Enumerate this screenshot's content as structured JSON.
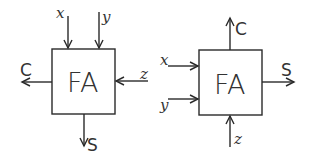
{
  "diagram": {
    "left": {
      "block_label": "FA",
      "inputs": [
        {
          "name": "x",
          "side": "top"
        },
        {
          "name": "y",
          "side": "top"
        },
        {
          "name": "z",
          "side": "right"
        }
      ],
      "outputs": [
        {
          "name": "C",
          "side": "left"
        },
        {
          "name": "S",
          "side": "bottom"
        }
      ]
    },
    "right": {
      "block_label": "FA",
      "inputs": [
        {
          "name": "x",
          "side": "left"
        },
        {
          "name": "y",
          "side": "left"
        },
        {
          "name": "z",
          "side": "bottom"
        }
      ],
      "outputs": [
        {
          "name": "C",
          "side": "top"
        },
        {
          "name": "S",
          "side": "right"
        }
      ]
    }
  }
}
